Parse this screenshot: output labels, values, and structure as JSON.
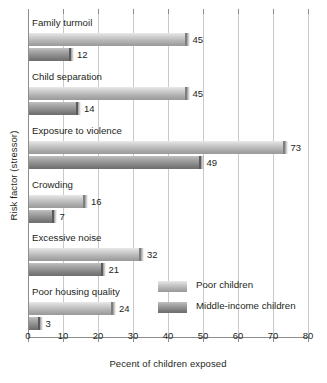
{
  "chart_data": {
    "type": "bar",
    "orientation": "horizontal",
    "title": "",
    "xlabel": "Pecent of children exposed",
    "ylabel": "Risk factor (stressor)",
    "xlim": [
      0,
      80
    ],
    "xticks": [
      0,
      10,
      20,
      30,
      40,
      50,
      60,
      70,
      80
    ],
    "grid": true,
    "legend_position": "inside-lower-right",
    "categories": [
      "Family turmoil",
      "Child separation",
      "Exposure to violence",
      "Crowding",
      "Excessive noise",
      "Poor housing quality"
    ],
    "series": [
      {
        "name": "Poor children",
        "color": "#b9b9b9",
        "values": [
          45,
          45,
          73,
          16,
          32,
          24
        ]
      },
      {
        "name": "Middle-income children",
        "color": "#8f8f8f",
        "values": [
          12,
          14,
          49,
          7,
          21,
          3
        ]
      }
    ]
  },
  "legend": {
    "items": [
      {
        "label": "Poor children",
        "swatch": "light"
      },
      {
        "label": "Middle-income children",
        "swatch": "dark"
      }
    ]
  },
  "axes": {
    "x_title": "Pecent of children exposed",
    "y_title": "Risk factor (stressor)",
    "x_tick_labels": [
      "0",
      "10",
      "20",
      "30",
      "40",
      "50",
      "60",
      "70",
      "80"
    ]
  }
}
